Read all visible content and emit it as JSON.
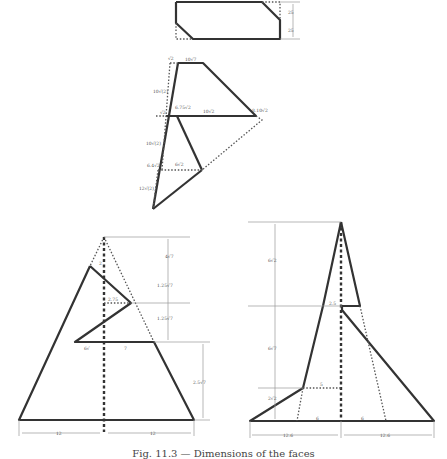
{
  "figure": {
    "caption": "Fig. 11.3 — Dimensions of the faces",
    "top_rectangle": {
      "dims": [
        "25",
        "25"
      ]
    },
    "middle_face": {
      "labels": {
        "top_edge": "10√7",
        "top_left_pt": "√2",
        "left_upper": "10√(2)",
        "inner_mid": "6.75√2",
        "mid_pt": "√2",
        "mid_edge": "10√2",
        "right_pt": "8.10√2",
        "left_lower_a": "10√(2)",
        "lower_pt": "6.4√2",
        "lower_edge": "6√2",
        "left_bottom": "12√(2)"
      }
    },
    "lower_left_face": {
      "labels": {
        "apex_gap": "2",
        "h1": "4√7",
        "h2": "1.25√7",
        "notch": "2.75",
        "h3": "1.25√7",
        "base_left": "6√",
        "base_right": "7",
        "h4": "2.5√7",
        "bottom_left": "12",
        "bottom_right": "12"
      }
    },
    "lower_right_face": {
      "labels": {
        "h1": "6√2",
        "notch": "2.5",
        "h2": "6√7",
        "step": "5",
        "h3": "2√2",
        "base_left_inner": "6",
        "base_right_inner": "6",
        "bottom_left": "12.6",
        "bottom_right": "12.6"
      }
    }
  }
}
